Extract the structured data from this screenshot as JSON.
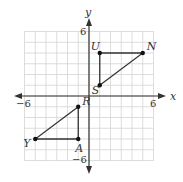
{
  "figure": {
    "type": "coordinate-plane",
    "axes": {
      "x_label": "x",
      "y_label": "y",
      "x_range": [
        -6,
        6
      ],
      "y_range": [
        -6,
        6
      ],
      "tick_labels": {
        "x_min": "−6",
        "x_max": "6",
        "y_max": "6",
        "y_min": "−6"
      }
    },
    "grid": {
      "spacing": 1,
      "color": "#d4d4d4"
    },
    "colors": {
      "axis": "#333333",
      "shape": "#333333",
      "point": "#111111"
    },
    "points": [
      {
        "label": "U",
        "x": 1,
        "y": 4
      },
      {
        "label": "N",
        "x": 5,
        "y": 4
      },
      {
        "label": "S",
        "x": 1,
        "y": 1
      },
      {
        "label": "R",
        "x": -1,
        "y": -1
      },
      {
        "label": "A",
        "x": -1,
        "y": -4
      },
      {
        "label": "Y",
        "x": -5,
        "y": -4
      }
    ],
    "triangles": [
      {
        "name": "UNS",
        "vertices": [
          "U",
          "N",
          "S"
        ]
      },
      {
        "name": "RAY",
        "vertices": [
          "R",
          "A",
          "Y"
        ]
      }
    ]
  }
}
